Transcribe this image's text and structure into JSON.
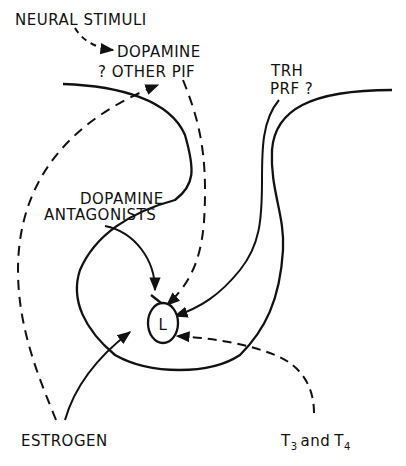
{
  "diagram": {
    "type": "regulation-schematic",
    "background": "#ffffff",
    "ink_color": "#111111",
    "labels": {
      "neural_stimuli": "NEURAL STIMULI",
      "dopamine": "DOPAMINE",
      "other_pif": "? OTHER PIF",
      "trh": "TRH",
      "prf": "PRF ?",
      "dopamine_antagonists_line1": "DOPAMINE",
      "dopamine_antagonists_line2": "ANTAGONISTS",
      "lactotroph": "L",
      "estrogen": "ESTROGEN",
      "t3_t": "T",
      "t3_sub": "3",
      "t_and": "and",
      "t4_t": "T",
      "t4_sub": "4"
    },
    "edges": [
      {
        "from": "NEURAL STIMULI",
        "to": "DOPAMINE ? OTHER PIF",
        "style": "dashed",
        "effect": "stimulate"
      },
      {
        "from": "ESTROGEN",
        "to": "DOPAMINE ? OTHER PIF",
        "style": "dashed",
        "effect": "stimulate"
      },
      {
        "from": "DOPAMINE ? OTHER PIF",
        "to": "L",
        "style": "dashed",
        "effect": "inhibit"
      },
      {
        "from": "DOPAMINE ANTAGONISTS",
        "to": "L",
        "style": "solid",
        "effect": "block inhibition"
      },
      {
        "from": "TRH PRF ?",
        "to": "L",
        "style": "solid",
        "effect": "stimulate"
      },
      {
        "from": "ESTROGEN",
        "to": "L",
        "style": "solid",
        "effect": "stimulate"
      },
      {
        "from": "T3 and T4",
        "to": "L",
        "style": "dashed",
        "effect": "stimulate"
      }
    ]
  }
}
